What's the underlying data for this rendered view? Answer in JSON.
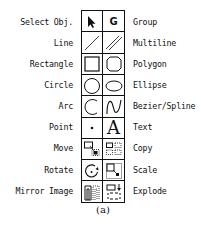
{
  "palette": {
    "rows": [
      {
        "left": {
          "label": "Select Obj.",
          "icon": "arrow-pointer-icon"
        },
        "right": {
          "label": "Group",
          "icon": "group-g-icon",
          "glyph": "G"
        }
      },
      {
        "left": {
          "label": "Line",
          "icon": "line-icon"
        },
        "right": {
          "label": "Multiline",
          "icon": "multiline-icon"
        }
      },
      {
        "left": {
          "label": "Rectangle",
          "icon": "rectangle-icon"
        },
        "right": {
          "label": "Polygon",
          "icon": "polygon-icon"
        }
      },
      {
        "left": {
          "label": "Circle",
          "icon": "circle-icon"
        },
        "right": {
          "label": "Ellipse",
          "icon": "ellipse-icon"
        }
      },
      {
        "left": {
          "label": "Arc",
          "icon": "arc-icon"
        },
        "right": {
          "label": "Bezier/Spline",
          "icon": "bezier-spline-icon"
        }
      },
      {
        "left": {
          "label": "Point",
          "icon": "point-icon"
        },
        "right": {
          "label": "Text",
          "icon": "text-a-icon",
          "glyph": "A"
        }
      },
      {
        "left": {
          "label": "Move",
          "icon": "move-icon"
        },
        "right": {
          "label": "Copy",
          "icon": "copy-icon"
        }
      },
      {
        "left": {
          "label": "Rotate",
          "icon": "rotate-icon"
        },
        "right": {
          "label": "Scale",
          "icon": "scale-icon"
        }
      },
      {
        "left": {
          "label": "Mirror Image",
          "icon": "mirror-image-icon"
        },
        "right": {
          "label": "Explode",
          "icon": "explode-icon"
        }
      }
    ],
    "caption": "(a)"
  }
}
